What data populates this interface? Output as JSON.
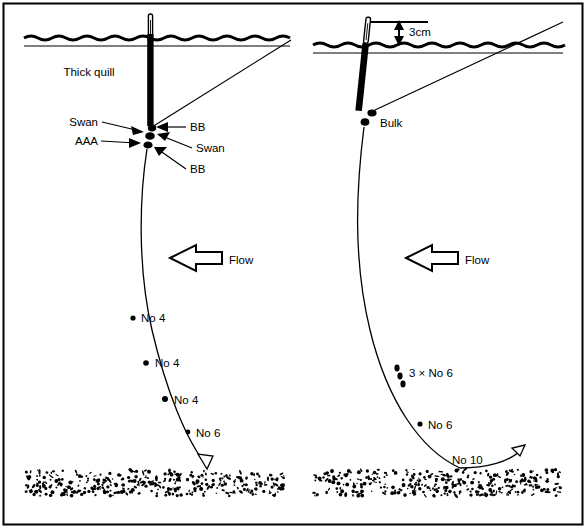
{
  "figure": {
    "border_color": "#000000",
    "background_color": "#ffffff",
    "ink_color": "#000000",
    "width": 586,
    "height": 528
  },
  "common": {
    "flow_label": "Flow",
    "flow_arrow_direction": "left",
    "water_surface_name": "water-surface",
    "riverbed_name": "riverbed-gravel"
  },
  "left_panel": {
    "name": "left-rig-diagram",
    "float_label": "Thick quill",
    "shot_labels": [
      {
        "text": "Swan",
        "side": "left",
        "id": "swan-upper"
      },
      {
        "text": "AAA",
        "side": "left",
        "id": "aaa"
      },
      {
        "text": "BB",
        "side": "right",
        "id": "bb-upper"
      },
      {
        "text": "Swan",
        "side": "right",
        "id": "swan-lower"
      },
      {
        "text": "BB",
        "side": "right",
        "id": "bb-lower"
      }
    ],
    "dropper_labels": [
      {
        "text": "No 4",
        "id": "dropper-1"
      },
      {
        "text": "No 4",
        "id": "dropper-2"
      },
      {
        "text": "No 4",
        "id": "dropper-3"
      },
      {
        "text": "No 6",
        "id": "dropper-4"
      }
    ],
    "flow_label": "Flow"
  },
  "right_panel": {
    "name": "right-rig-diagram",
    "depth_label": "3cm",
    "bulk_label": "Bulk",
    "dropper_labels": [
      {
        "text": "3 × No 6",
        "id": "dropper-1"
      },
      {
        "text": "No 6",
        "id": "dropper-2"
      },
      {
        "text": "No 10",
        "id": "dropper-hook"
      }
    ],
    "flow_label": "Flow"
  },
  "chart_data": {
    "type": "diagram",
    "panels": [
      {
        "name": "Thick quill rig",
        "float": "Thick quill",
        "shots_at_float": [
          "Swan",
          "AAA",
          "BB",
          "Swan",
          "BB"
        ],
        "droppers": [
          "No 4",
          "No 4",
          "No 4",
          "No 6"
        ],
        "flow": "right to left"
      },
      {
        "name": "Bulk rig",
        "float": "stick float, 3cm above water",
        "shots_at_float": [
          "Bulk"
        ],
        "droppers": [
          "3 × No 6",
          "No 6",
          "No 10"
        ],
        "flow": "right to left"
      }
    ]
  }
}
